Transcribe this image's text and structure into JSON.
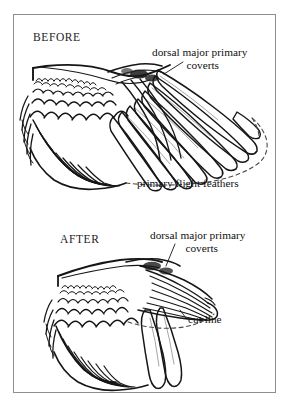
{
  "figure": {
    "type": "anatomical-diagram",
    "background_color": "#ffffff",
    "ink_color": "#1a1a1a",
    "frame_color": "#8e8e8e"
  },
  "panels": [
    {
      "id": "before",
      "title": "BEFORE",
      "labels": [
        {
          "id": "dorsal-major-primary-coverts",
          "line1": "dorsal major primary",
          "line2": "coverts"
        },
        {
          "id": "primary-flight-feathers",
          "line1": "primary flight feathers",
          "line2": ""
        }
      ]
    },
    {
      "id": "after",
      "title": "AFTER",
      "labels": [
        {
          "id": "dorsal-major-primary-coverts",
          "line1": "dorsal major primary",
          "line2": "coverts"
        },
        {
          "id": "cut-line",
          "line1": "cut line",
          "line2": ""
        }
      ]
    }
  ],
  "icons": {
    "wing_before": "bird-wing-extended-icon",
    "wing_after": "bird-wing-trimmed-icon",
    "dashed_outline_before": "dashed-feather-outline-icon",
    "dashed_outline_after": "dashed-cut-line-icon"
  }
}
